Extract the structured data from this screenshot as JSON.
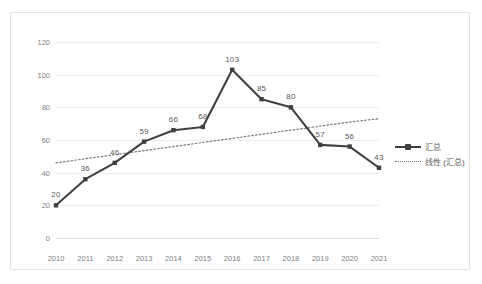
{
  "chart_data": {
    "type": "line",
    "title": "",
    "subtitle": "",
    "xlabel": "",
    "ylabel": "",
    "categories": [
      "2010",
      "2011",
      "2012",
      "2013",
      "2014",
      "2015",
      "2016",
      "2017",
      "2018",
      "2019",
      "2020",
      "2021"
    ],
    "series": [
      {
        "name": "汇总",
        "style": "solid-line-with-square-markers",
        "color": "#404040",
        "values": [
          20,
          36,
          46,
          59,
          66,
          68,
          103,
          85,
          80,
          57,
          56,
          43
        ],
        "data_labels": [
          "20",
          "36",
          "46",
          "59",
          "66",
          "68",
          "103",
          "85",
          "80",
          "57",
          "56",
          "43"
        ]
      },
      {
        "name": "线性 (汇总)",
        "style": "dotted-trendline",
        "color": "#7a7a7a",
        "values": [
          46.0,
          48.5,
          51.0,
          53.5,
          56.0,
          58.5,
          61.0,
          63.5,
          66.0,
          68.5,
          71.0,
          73.0
        ],
        "data_labels": []
      }
    ],
    "ylim": [
      0,
      120
    ],
    "yticks": [
      0,
      20,
      40,
      60,
      80,
      100,
      120
    ],
    "ytick_labels": [
      "0",
      "20",
      "40",
      "60",
      "80",
      "100",
      "120"
    ],
    "grid": "horizontal",
    "legend_position": "right",
    "legend_entries": [
      "汇总",
      "线性 (汇总)"
    ],
    "colors": {
      "series_line": "#404040",
      "trendline": "#7a7a7a",
      "gridline": "#ededed",
      "axis_text": "#808080",
      "label_text": "#595959",
      "chart_border": "#e3e3e3",
      "background": "#ffffff"
    }
  }
}
